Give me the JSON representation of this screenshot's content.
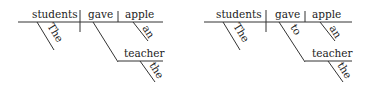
{
  "diagrams": [
    {
      "subject": "students",
      "verb": "gave",
      "direct_object": "apple",
      "subject_modifier": "The",
      "object_modifier": "an",
      "indirect_object": "teacher",
      "indirect_object_modifier": "the",
      "preposition": ""
    },
    {
      "subject": "students",
      "verb": "gave",
      "direct_object": "apple",
      "subject_modifier": "The",
      "object_modifier": "an",
      "indirect_object": "teacher",
      "indirect_object_modifier": "the",
      "preposition": "to"
    }
  ]
}
